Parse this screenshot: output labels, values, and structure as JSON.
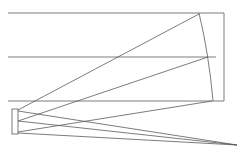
{
  "diagram": {
    "stroke_color": "#555555",
    "canvas": {
      "width": 242,
      "height": 151
    }
  }
}
